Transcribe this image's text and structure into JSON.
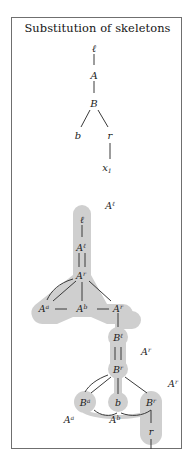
{
  "figure": {
    "title": "Substitution of skeletons",
    "border_color": "#6f6f6f",
    "shade_color": "#cfcfcf",
    "line_color": "#3a3a3a",
    "text_color": "#1b1b1b"
  },
  "tree_top": {
    "name": "source-skeleton-tree",
    "nodes": [
      {
        "id": "t-l",
        "label": "ℓ",
        "x": 94,
        "y": 50
      },
      {
        "id": "t-A",
        "label": "A",
        "x": 94,
        "y": 77
      },
      {
        "id": "t-B",
        "label": "B",
        "x": 94,
        "y": 105
      },
      {
        "id": "t-b",
        "label": "b",
        "x": 79,
        "y": 135
      },
      {
        "id": "t-r",
        "label": "r",
        "x": 110,
        "y": 135
      },
      {
        "id": "t-x1",
        "label": "x",
        "sub": "1",
        "x": 112,
        "y": 166
      }
    ],
    "edges": [
      {
        "from": "t-l",
        "to": "t-A"
      },
      {
        "from": "t-A",
        "to": "t-B"
      },
      {
        "from": "t-B",
        "to": "t-b"
      },
      {
        "from": "t-B",
        "to": "t-r"
      },
      {
        "from": "t-r",
        "to": "t-x1"
      }
    ]
  },
  "tree_bottom": {
    "name": "substituted-skeleton-tree",
    "nodes": [
      {
        "id": "b-l",
        "label": "ℓ",
        "x": 80,
        "y": 220
      },
      {
        "id": "b-Al",
        "label": "A",
        "sup": "ℓ",
        "x": 80,
        "y": 248
      },
      {
        "id": "b-Ar1",
        "label": "A",
        "sup": "r",
        "x": 80,
        "y": 275
      },
      {
        "id": "b-Aa",
        "label": "A",
        "sup": "a",
        "x": 44,
        "y": 302
      },
      {
        "id": "b-Ab",
        "label": "A",
        "sup": "b",
        "x": 80,
        "y": 302
      },
      {
        "id": "b-Ar2",
        "label": "A",
        "sup": "r",
        "x": 117,
        "y": 302
      },
      {
        "id": "b-Bl",
        "label": "B",
        "sup": "ℓ",
        "x": 117,
        "y": 330
      },
      {
        "id": "b-Br1",
        "label": "B",
        "sup": "r",
        "x": 117,
        "y": 362
      },
      {
        "id": "b-Ba",
        "label": "B",
        "sup": "a",
        "x": 84,
        "y": 395
      },
      {
        "id": "b-b",
        "label": "b",
        "x": 117,
        "y": 395
      },
      {
        "id": "b-Br2",
        "label": "B",
        "sup": "r",
        "x": 150,
        "y": 395
      },
      {
        "id": "b-r",
        "label": "r",
        "x": 150,
        "y": 421
      },
      {
        "id": "b-x1",
        "label": "x",
        "sub": "1",
        "x": 150,
        "y": 446
      }
    ],
    "annotations": [
      {
        "id": "an-Al",
        "label": "A",
        "sup": "ℓ",
        "x": 110,
        "y": 205
      },
      {
        "id": "an-Ar1",
        "label": "A",
        "sup": "r",
        "x": 146,
        "y": 348
      },
      {
        "id": "an-Ar2",
        "label": "A",
        "sup": "r",
        "x": 174,
        "y": 381
      },
      {
        "id": "an-Aa",
        "label": "A",
        "sup": "a",
        "x": 70,
        "y": 414
      },
      {
        "id": "an-Ab",
        "label": "A",
        "sup": "b",
        "x": 114,
        "y": 414
      }
    ]
  }
}
